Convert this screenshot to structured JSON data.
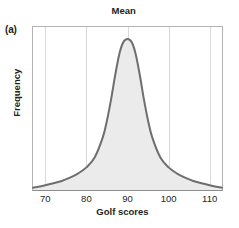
{
  "figure": {
    "panel_label": "(a)",
    "title": "Mean",
    "xlabel": "Golf scores",
    "ylabel": "Frequency"
  },
  "colors": {
    "curve": "#6e6e6e",
    "fill": "#ebebeb",
    "gridline": "#d9d9d9",
    "frame": "#b3b3b3",
    "text": "#231f20",
    "background": "#ffffff"
  },
  "chart_data": {
    "type": "line",
    "title": "Mean",
    "xlabel": "Golf scores",
    "ylabel": "Frequency",
    "xlim": [
      67,
      113
    ],
    "ylim": [
      0,
      1.08
    ],
    "xticks": [
      70,
      80,
      90,
      100,
      110
    ],
    "xtick_labels": [
      "70",
      "80",
      "90",
      "100",
      "110"
    ],
    "yticks": [],
    "ytick_labels": [],
    "grid": "vertical",
    "legend": "none",
    "annotations": [
      {
        "text": "Mean",
        "x": 90,
        "position": "above-axis",
        "note": "label marks the mean of the distribution at x = 90"
      },
      {
        "text": "(a)",
        "position": "top-left",
        "note": "panel identifier"
      }
    ],
    "series": [
      {
        "name": "Golf score distribution",
        "shape": "symmetric leptokurtic bell curve (peaked with heavy tails)",
        "mean": 90,
        "peak_x": 90,
        "peak_y": 1.0,
        "filled": true,
        "x": [
          67,
          68,
          70,
          72,
          74,
          76,
          78,
          80,
          82,
          84,
          85,
          86,
          87,
          88,
          89,
          90,
          91,
          92,
          93,
          94,
          95,
          96,
          98,
          100,
          102,
          104,
          106,
          108,
          110,
          112,
          113
        ],
        "y": [
          0.015,
          0.02,
          0.032,
          0.045,
          0.06,
          0.082,
          0.11,
          0.15,
          0.215,
          0.35,
          0.46,
          0.6,
          0.76,
          0.9,
          0.98,
          1.0,
          0.98,
          0.9,
          0.76,
          0.6,
          0.46,
          0.35,
          0.215,
          0.15,
          0.11,
          0.082,
          0.06,
          0.045,
          0.032,
          0.02,
          0.015
        ]
      }
    ]
  }
}
